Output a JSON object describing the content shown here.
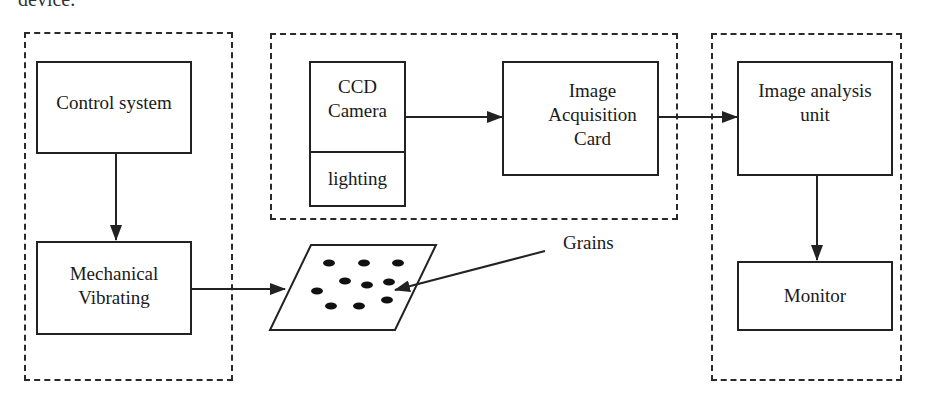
{
  "caption_fragment": "device.",
  "groups": {
    "mechanical": {
      "label": ""
    },
    "acquisition": {
      "label": ""
    },
    "analysis": {
      "label": ""
    }
  },
  "nodes": {
    "control_system": "Control system",
    "mechanical_vibrating": "Mechanical\nVibrating",
    "ccd_camera": "CCD\nCamera",
    "lighting": "lighting",
    "image_acquisition_card": "Image\nAcquisition\nCard",
    "image_analysis_unit": "Image analysis\nunit",
    "monitor": "Monitor",
    "grains_label": "Grains"
  },
  "edges": [
    {
      "from": "Control system",
      "to": "Mechanical Vibrating"
    },
    {
      "from": "Mechanical Vibrating",
      "to": "Grain tray"
    },
    {
      "from": "CCD Camera",
      "to": "Image Acquisition Card"
    },
    {
      "from": "Image Acquisition Card",
      "to": "Image analysis unit"
    },
    {
      "from": "Image analysis unit",
      "to": "Monitor"
    },
    {
      "from": "Grains label",
      "to": "Grain tray"
    }
  ],
  "colors": {
    "stroke": "#222222",
    "background": "#ffffff"
  }
}
